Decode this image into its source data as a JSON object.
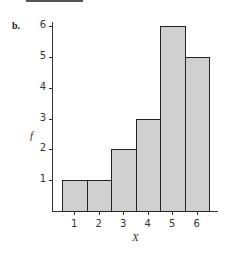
{
  "panel_label": "b.",
  "chart_data": {
    "type": "bar",
    "title": "",
    "xlabel": "X",
    "ylabel": "f",
    "categories": [
      "1",
      "2",
      "3",
      "4",
      "5",
      "6"
    ],
    "values": [
      1,
      1,
      2,
      3,
      6,
      5
    ],
    "yticks": [
      "1",
      "2",
      "3",
      "4",
      "5",
      "6"
    ],
    "ylim": [
      0,
      6
    ],
    "grid": false,
    "legend": null,
    "bar_color": "#d0d0d0",
    "edge_color": "#222222",
    "histogram_style": true
  }
}
